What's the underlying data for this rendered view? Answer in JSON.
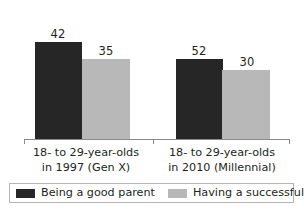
{
  "chart_data": {
    "type": "bar",
    "title": "",
    "xlabel": "",
    "ylabel": "",
    "ylim": [
      0,
      60
    ],
    "grid": false,
    "legend_position": "bottom",
    "categories": [
      "18- to 29-year-olds in 1997 (Gen X)",
      "18- to 29-year-olds in 2010 (Millennial)"
    ],
    "category_lines": [
      [
        "18- to 29-year-olds",
        "in 1997 (Gen X)"
      ],
      [
        "18- to 29-year-olds",
        "in 2010 (Millennial)"
      ]
    ],
    "series": [
      {
        "name": "Being a good parent",
        "color": "#262626",
        "values": [
          42,
          35
        ]
      },
      {
        "name": "Having a successful marriage",
        "color": "#b8b8b8",
        "values": [
          35,
          30
        ]
      }
    ],
    "data_labels": {
      "group_0": {
        "parent": "42",
        "marriage": "35"
      },
      "group_1": {
        "parent": "52",
        "marriage": "30"
      }
    },
    "values_by_group": [
      {
        "category": "18- to 29-year-olds in 1997 (Gen X)",
        "being_a_good_parent": 42,
        "having_a_successful_marriage": 35
      },
      {
        "category": "18- to 29-year-olds in 2010 (Millennial)",
        "being_a_good_parent": 52,
        "having_a_successful_marriage": 30
      }
    ]
  },
  "legend": {
    "items": [
      {
        "label": "Being a good parent",
        "color": "#262626"
      },
      {
        "label": "Having a successful marriage",
        "color": "#b8b8b8"
      }
    ]
  },
  "colors": {
    "series_dark": "#262626",
    "series_gray": "#b8b8b8",
    "axis": "#8a8a8a",
    "text": "#231f20",
    "legend_border": "#b5b5b5",
    "background": "#ffffff"
  }
}
